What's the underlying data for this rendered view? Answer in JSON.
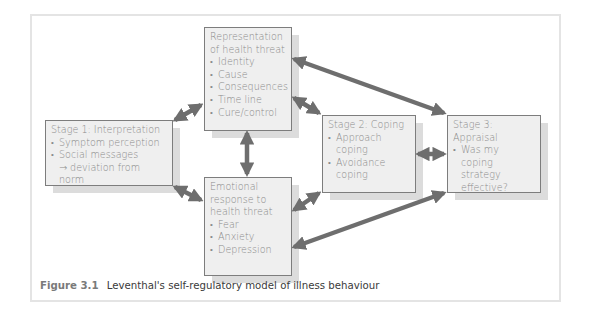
{
  "figure": {
    "label": "Figure 3.1",
    "title": "Leventhal's self-regulatory model of illness behaviour"
  },
  "boxes": {
    "representation": {
      "title_lines": [
        "Representation",
        "of health threat"
      ],
      "items": [
        "Identity",
        "Cause",
        "Consequences",
        "Time line",
        "Cure/control"
      ]
    },
    "stage1": {
      "title": "Stage 1: Interpretation",
      "items": [
        "Symptom perception",
        "Social messages"
      ],
      "continuation": "→ deviation from norm"
    },
    "emotional": {
      "title_lines": [
        "Emotional",
        "response to",
        "health threat"
      ],
      "items": [
        "Fear",
        "Anxiety",
        "Depression"
      ]
    },
    "stage2": {
      "title": "Stage 2: Coping",
      "items": [
        {
          "line1": "Approach",
          "line2": "coping"
        },
        {
          "line1": "Avoidance",
          "line2": "coping"
        }
      ]
    },
    "stage3": {
      "title": "Stage 3: Appraisal",
      "item_lines": [
        "Was my",
        "coping",
        "strategy",
        "effective?"
      ]
    }
  },
  "connections": [
    {
      "from": "stage1",
      "to": "representation",
      "type": "bidirectional"
    },
    {
      "from": "stage1",
      "to": "emotional",
      "type": "bidirectional"
    },
    {
      "from": "representation",
      "to": "emotional",
      "type": "bidirectional"
    },
    {
      "from": "representation",
      "to": "stage2",
      "type": "bidirectional"
    },
    {
      "from": "representation",
      "to": "stage3",
      "type": "bidirectional"
    },
    {
      "from": "emotional",
      "to": "stage2",
      "type": "bidirectional"
    },
    {
      "from": "emotional",
      "to": "stage3",
      "type": "bidirectional"
    },
    {
      "from": "stage2",
      "to": "stage3",
      "type": "bidirectional"
    }
  ],
  "colors": {
    "box_fill": "#efefef",
    "box_border": "#7d7d7d",
    "shadow": "#dcdcdc",
    "arrow": "#6e6e6e",
    "text": "#8a8a8a",
    "frame": "#e4e4e4"
  }
}
